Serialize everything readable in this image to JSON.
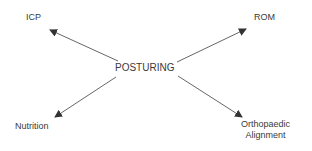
{
  "diagram": {
    "center": {
      "label": "POSTURING"
    },
    "nodes": [
      {
        "id": "icp",
        "label": "ICP"
      },
      {
        "id": "rom",
        "label": "ROM"
      },
      {
        "id": "nutrition",
        "label": "Nutrition"
      },
      {
        "id": "orthopaedic",
        "label_line1": "Orthopaedic",
        "label_line2": "Alignment"
      }
    ],
    "edges": [
      {
        "from": "POSTURING",
        "to": "ICP"
      },
      {
        "from": "POSTURING",
        "to": "ROM"
      },
      {
        "from": "POSTURING",
        "to": "Nutrition"
      },
      {
        "from": "POSTURING",
        "to": "Orthopaedic Alignment"
      }
    ],
    "colors": {
      "line": "#555555",
      "text": "#3a3a3a",
      "background": "#ffffff"
    }
  }
}
